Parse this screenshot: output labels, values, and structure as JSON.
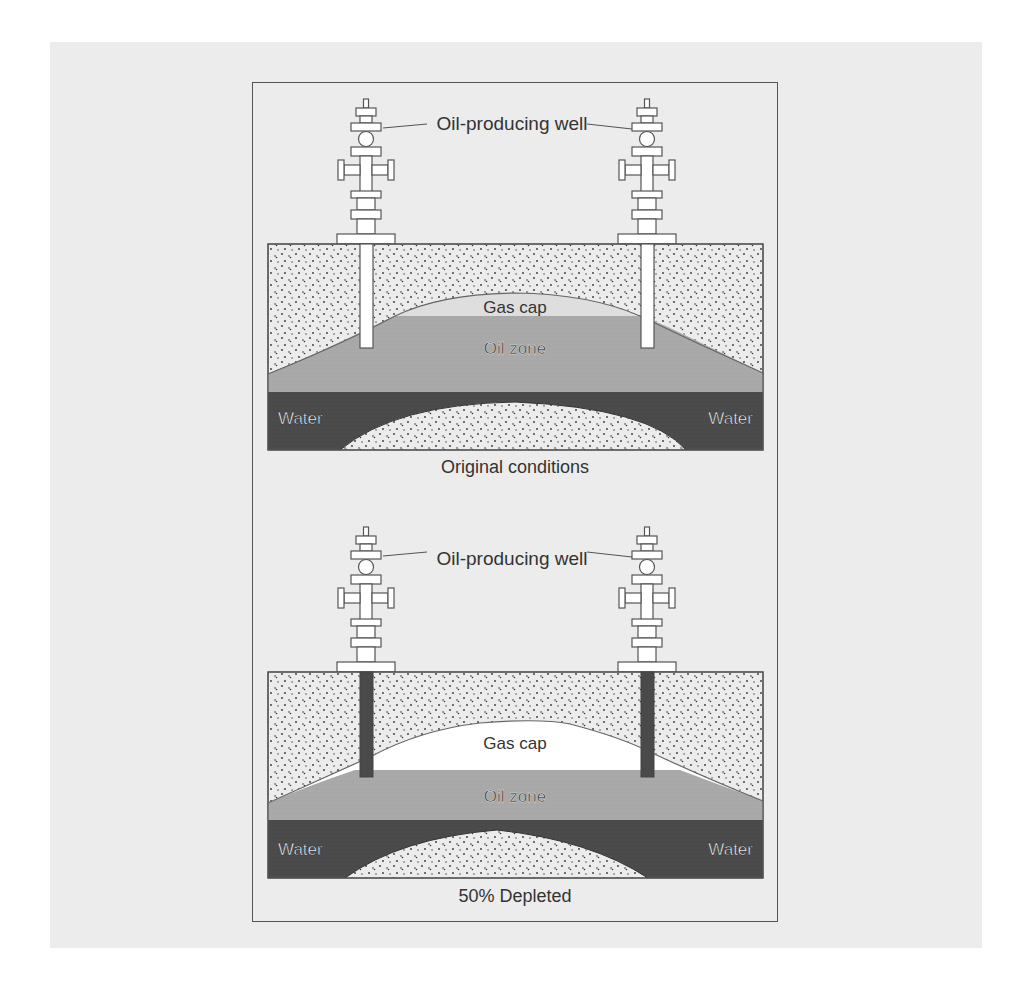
{
  "figure": {
    "background_color": "#ececec",
    "colors": {
      "rock": "#ececec",
      "gas_cap_original": "#e0e0e0",
      "gas_cap_depleted": "#ffffff",
      "oil_zone": "#a8a8a8",
      "water": "#4a4a4a",
      "pipe_original": "#ffffff",
      "pipe_depleted": "#4a4a4a",
      "outline": "#555555"
    },
    "panels": [
      {
        "id": "original",
        "well_label": "Oil-producing well",
        "gas_cap_label": "Gas cap",
        "oil_zone_label": "Oil zone",
        "water_left_label": "Water",
        "water_right_label": "Water",
        "caption": "Original conditions"
      },
      {
        "id": "depleted",
        "well_label": "Oil-producing well",
        "gas_cap_label": "Gas cap",
        "oil_zone_label": "Oil zone",
        "water_left_label": "Water",
        "water_right_label": "Water",
        "caption": "50% Depleted"
      }
    ]
  }
}
